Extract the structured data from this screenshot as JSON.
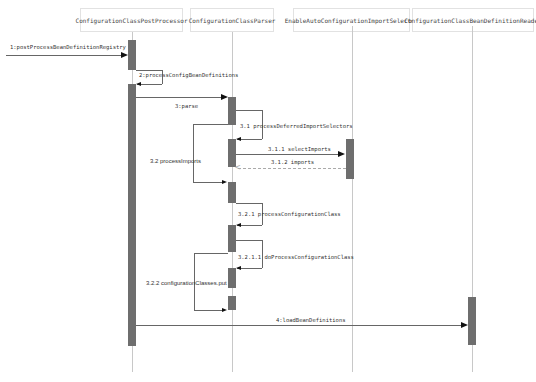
{
  "diagram": {
    "type": "sequence",
    "participants": [
      {
        "id": "p1",
        "name": "ConfigurationClassPostProcessor"
      },
      {
        "id": "p2",
        "name": "ConfigurationClassParser"
      },
      {
        "id": "p3",
        "name": "EnableAutoConfigurationImportSelector"
      },
      {
        "id": "p4",
        "name": "ConfigurationClassBeanDefinitionReader"
      }
    ],
    "messages": [
      {
        "label": "1:postProcessBeanDefinitionRegistry",
        "from": "external",
        "to": "p1",
        "kind": "sync"
      },
      {
        "label": "2:processConfigBeanDefinitions",
        "from": "p1",
        "to": "p1",
        "kind": "self"
      },
      {
        "label": "3:parse",
        "from": "p1",
        "to": "p2",
        "kind": "sync"
      },
      {
        "label": "3.1 processDeferredImportSelectors",
        "from": "p2",
        "to": "p2",
        "kind": "self"
      },
      {
        "label": "3.1.1 selectImports",
        "from": "p2",
        "to": "p3",
        "kind": "sync"
      },
      {
        "label": "3.1.2 imports",
        "from": "p3",
        "to": "p2",
        "kind": "return"
      },
      {
        "label": "3.2 processImports",
        "from": "p2",
        "to": "p2",
        "kind": "self-left"
      },
      {
        "label": "3.2.1 processConfigurationClass",
        "from": "p2",
        "to": "p2",
        "kind": "self"
      },
      {
        "label": "3.2.1.1 doProcessConfigurationClass",
        "from": "p2",
        "to": "p2",
        "kind": "self"
      },
      {
        "label": "3.2.2 configurationClasses.put",
        "from": "p2",
        "to": "p2",
        "kind": "self-left"
      },
      {
        "label": "4:loadBeanDefinitions",
        "from": "p1",
        "to": "p4",
        "kind": "sync"
      }
    ],
    "colors": {
      "activation": "#6e6e6e",
      "lifeline": "#c8c8c8",
      "border": "#e2e2e2"
    }
  }
}
